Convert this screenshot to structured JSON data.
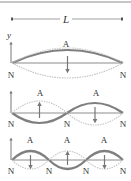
{
  "figure": {
    "length_label": "L",
    "axis_label": "y",
    "colors": {
      "border": "#b3b3b3",
      "baseline": "#6e6e6e",
      "wave_solid": "#7f7f7f",
      "wave_dotted": "#bdbdbd",
      "arrow": "#777777",
      "text": "#333333"
    },
    "modes": [
      {
        "harmonic": 1,
        "antinode_label": "A",
        "node_label": "N",
        "antinodes": [
          "A"
        ],
        "nodes": [
          "N",
          "N"
        ]
      },
      {
        "harmonic": 2,
        "antinode_label": "A",
        "node_label": "N",
        "antinodes": [
          "A",
          "A"
        ],
        "nodes": [
          "N",
          "N",
          "N"
        ]
      },
      {
        "harmonic": 3,
        "antinode_label": "A",
        "node_label": "N",
        "antinodes": [
          "A",
          "A",
          "A"
        ],
        "nodes": [
          "N",
          "N",
          "N",
          "N"
        ]
      }
    ]
  }
}
